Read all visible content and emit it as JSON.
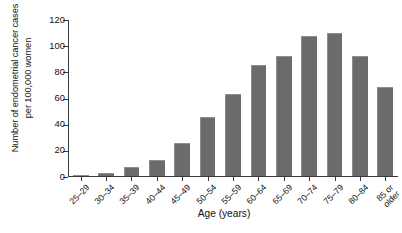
{
  "chart_data": {
    "type": "bar",
    "title": "",
    "xlabel": "Age (years)",
    "ylabel": "Number of endometrial cancer cases\nper 100,000 women",
    "categories": [
      "25–29",
      "30–34",
      "35–39",
      "40–44",
      "45–49",
      "50–54",
      "55–59",
      "60–64",
      "65–69",
      "70–74",
      "75–79",
      "80–84",
      "85 or\nolder"
    ],
    "values": [
      0.5,
      2,
      7,
      12,
      25,
      45,
      63,
      85,
      92,
      107,
      109,
      92,
      68
    ],
    "ylim": [
      0,
      120
    ],
    "yticks": [
      0,
      20,
      40,
      60,
      80,
      100,
      120
    ],
    "ytick_labels": [
      "0",
      "20",
      "40",
      "60",
      "80",
      "100",
      "120"
    ],
    "grid": false,
    "legend": null,
    "bar_color": "#6b6b6b",
    "axis_color": "#3a3a3a",
    "background": "#ffffff"
  }
}
